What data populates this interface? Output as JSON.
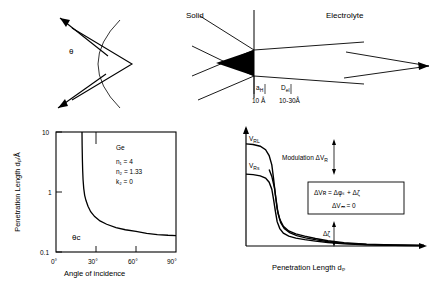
{
  "panel_incidence": {
    "name": "angle-of-incidence-schematic",
    "angle_label": "θ",
    "incoming_ray_name": "incoming-ray",
    "reflected_ray_name": "reflected-ray",
    "arc_name": "angle-arc"
  },
  "panel_interface": {
    "name": "solid-electrolyte-interface-schematic",
    "left_label": "Solid",
    "right_label": "Electrolyte",
    "marker_inner": "a",
    "marker_inner_sub": "H",
    "marker_outer": "D",
    "marker_outer_sub": "el",
    "value_inner": "10 Å",
    "value_outer": "10-30Å"
  },
  "chart_data": [
    {
      "type": "line",
      "name": "penetration-length-vs-angle",
      "title": "",
      "xlabel": "Angle  of  incidence",
      "ylabel": "Penetration Length  dₚ/Å",
      "xlim": [
        0,
        90
      ],
      "ylim": [
        0.1,
        10
      ],
      "yscale": "log",
      "xticks": [
        0,
        30,
        60,
        90
      ],
      "xticklabels": [
        "0°",
        "30°",
        "60°",
        "90°"
      ],
      "yticks": [
        0.1,
        1,
        10
      ],
      "yticklabels": [
        "0.1",
        "1",
        "10"
      ],
      "grid": false,
      "annotations": [
        {
          "text": "Ge",
          "x": 44,
          "y": 5.2
        },
        {
          "text": "n₁ = 4",
          "x": 44,
          "y": 3.1
        },
        {
          "text": "n₂ = 1.33",
          "x": 44,
          "y": 2.25
        },
        {
          "text": "k₂ = 0",
          "x": 44,
          "y": 1.65
        },
        {
          "text": "θᴄ",
          "x": 16,
          "y": 0.17
        }
      ],
      "series": [
        {
          "name": "penetration-depth-curve",
          "x": [
            19.5,
            19.6,
            19.8,
            20.0,
            20.3,
            20.8,
            21.5,
            22.5,
            24,
            26,
            29,
            33,
            38,
            45,
            52,
            60,
            68,
            76,
            84,
            90
          ],
          "y": [
            10,
            6.0,
            3.4,
            2.3,
            1.6,
            1.15,
            0.88,
            0.72,
            0.58,
            0.47,
            0.39,
            0.33,
            0.29,
            0.255,
            0.235,
            0.22,
            0.205,
            0.195,
            0.19,
            0.188
          ]
        }
      ]
    },
    {
      "type": "line",
      "name": "potential-vs-penetration-length",
      "title": "",
      "xlabel": "Penetration Length  dₚ",
      "ylabel": "",
      "grid": false,
      "y_axis_annotations": [
        {
          "text": "V",
          "sub": "RL",
          "name": "v-rl-label"
        },
        {
          "text": "V",
          "sub": "Rs",
          "name": "v-rs-label"
        }
      ],
      "annotations": [
        {
          "text": "Modulation  ΔV",
          "sub": "R",
          "name": "modulation-label"
        },
        {
          "text": "Δζ",
          "name": "delta-zeta-label"
        }
      ],
      "equation_box": {
        "name": "equation-box",
        "line1": "ΔVʀ = Δφₛ + Δζ",
        "line2": "ΔVₘ = 0"
      },
      "series": [
        {
          "name": "curve-upper-vrl",
          "x": [
            0,
            8,
            16,
            22,
            26,
            29,
            31,
            33,
            35,
            38,
            42,
            48,
            56,
            66,
            78,
            92,
            110,
            135,
            165,
            200
          ],
          "y": [
            88,
            87.5,
            86,
            83,
            78,
            70,
            58,
            44,
            32,
            23,
            17,
            13,
            10.5,
            8.5,
            6.5,
            4.5,
            2.8,
            1.6,
            0.9,
            0.5
          ]
        },
        {
          "name": "curve-lower-vrs",
          "x": [
            0,
            8,
            16,
            22,
            26,
            29,
            31,
            33,
            35,
            38,
            42,
            48,
            56,
            66,
            78,
            92,
            110,
            135,
            165,
            200
          ],
          "y": [
            62,
            61.5,
            60.5,
            58.5,
            55,
            49,
            40,
            30,
            21,
            15,
            11,
            8.5,
            6.8,
            5.5,
            4.2,
            3.0,
            1.9,
            1.1,
            0.6,
            0.3
          ]
        },
        {
          "name": "curve-middle",
          "x": [
            26,
            29,
            32,
            34,
            36,
            39,
            43,
            49,
            57,
            67,
            79,
            93,
            111,
            136,
            166,
            200
          ],
          "y": [
            66,
            60,
            50,
            39,
            28,
            20,
            15,
            11.5,
            9,
            7,
            5.3,
            3.7,
            2.3,
            1.3,
            0.7,
            0.4
          ]
        }
      ]
    }
  ]
}
